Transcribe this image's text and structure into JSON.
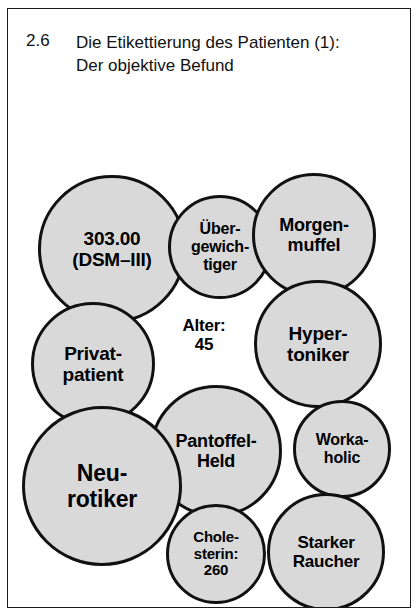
{
  "slide": {
    "number": "2.6",
    "title": "Die Etikettierung des Patienten (1):\nDer objektive Befund",
    "background_color": "#ffffff",
    "border_color": "#1a1a1a"
  },
  "diagram": {
    "type": "overlapping-circles",
    "fill_color": "#d9d9d9",
    "outline_color": "#111111",
    "bubbles": [
      {
        "id": "dsm",
        "label": "303.00\n(DSM–III)",
        "cx": 104,
        "cy": 240,
        "r": 74,
        "font_size": 19,
        "filled": true
      },
      {
        "id": "uebergewicht",
        "label": "Über-\ngewich-\ntiger",
        "cx": 212,
        "cy": 238,
        "r": 52,
        "font_size": 16,
        "filled": true
      },
      {
        "id": "morgenmuffel",
        "label": "Morgen-\nmuffel",
        "cx": 306,
        "cy": 226,
        "r": 62,
        "font_size": 18,
        "filled": true
      },
      {
        "id": "alter",
        "label": "Alter:\n45",
        "cx": 196,
        "cy": 326,
        "r": 40,
        "font_size": 17,
        "filled": false
      },
      {
        "id": "hypertoniker",
        "label": "Hyper-\ntoniker",
        "cx": 310,
        "cy": 335,
        "r": 64,
        "font_size": 19,
        "filled": true
      },
      {
        "id": "privatpatient",
        "label": "Privat-\npatient",
        "cx": 85,
        "cy": 355,
        "r": 62,
        "font_size": 19,
        "filled": true
      },
      {
        "id": "pantoffelheld",
        "label": "Pantoffel-\nHeld",
        "cx": 208,
        "cy": 442,
        "r": 66,
        "font_size": 18,
        "filled": true
      },
      {
        "id": "workaholic",
        "label": "Worka-\nholic",
        "cx": 334,
        "cy": 440,
        "r": 49,
        "font_size": 16,
        "filled": true
      },
      {
        "id": "neurotiker",
        "label": "Neu-\nrotiker",
        "cx": 94,
        "cy": 477,
        "r": 80,
        "font_size": 23,
        "filled": true
      },
      {
        "id": "cholesterin",
        "label": "Chole-\nsterin:\n260",
        "cx": 208,
        "cy": 545,
        "r": 50,
        "font_size": 15,
        "filled": true
      },
      {
        "id": "starkerraucher",
        "label": "Starker\nRaucher",
        "cx": 318,
        "cy": 543,
        "r": 59,
        "font_size": 17,
        "filled": true
      }
    ]
  }
}
